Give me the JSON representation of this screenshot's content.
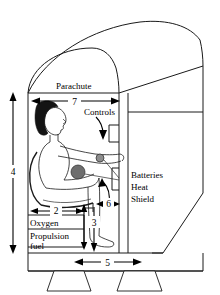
{
  "diagram": {
    "labels": {
      "parachute": "Parachute",
      "controls": "Controls",
      "batteries": "Batteries",
      "heat": "Heat",
      "shield": "Shield",
      "oxygen": "Oxygen",
      "propulsion": "Propulsion",
      "fuel": "fuel"
    },
    "dimensions": {
      "height_left": "4",
      "cabin_width_top": "7",
      "tank_width": "2",
      "leg_lower": "3",
      "base_width": "5",
      "seat_height": "6"
    },
    "colors": {
      "line": "#1a1a1a",
      "hair": "#141414",
      "knob_large": "#6e6e6e",
      "knob_small": "#8d8d8d",
      "background": "#ffffff"
    }
  }
}
